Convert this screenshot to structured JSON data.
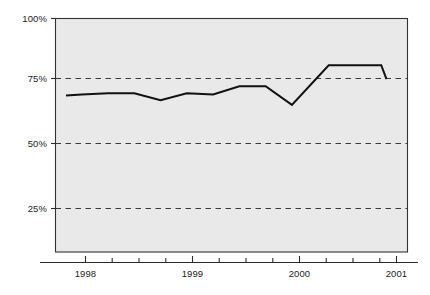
{
  "chart_data": {
    "type": "line",
    "title": "",
    "subtitle": "",
    "xlabel": "",
    "ylabel": "",
    "ylim": [
      0,
      100
    ],
    "xlim": [
      1997.75,
      2001.1
    ],
    "grid": true,
    "grid_style": "dashed-horizontal",
    "legend": "none",
    "y_ticks": [
      25,
      50,
      75,
      100
    ],
    "y_tick_labels": [
      "25%",
      "50%",
      "75%",
      "100%"
    ],
    "x_ticks": [
      1998,
      1999,
      2000,
      2001
    ],
    "x_tick_labels": [
      "1998",
      "1999",
      "2000",
      "2001"
    ],
    "x_minor_ticks": [
      1998.25,
      1998.5,
      1998.75,
      1999.25,
      1999.5,
      1999.75,
      2000.25,
      2000.5,
      2000.75
    ],
    "series": [
      {
        "name": "value",
        "color": "#111111",
        "x": [
          1997.85,
          1998.0,
          1998.25,
          1998.5,
          1998.75,
          1999.0,
          1999.25,
          1999.5,
          1999.75,
          2000.0,
          2000.35,
          2000.6,
          2000.85,
          2000.9
        ],
        "values": [
          67,
          67.5,
          68,
          68,
          65,
          68,
          67.5,
          71,
          71,
          63,
          80,
          80,
          80,
          74
        ]
      }
    ],
    "colors": {
      "plot_background": "#e9e9e9",
      "page_background": "#ffffff",
      "line": "#111111",
      "gridline": "#3a3a3a",
      "axis": "#2b2b2b",
      "tick_text": "#1d1d1d"
    }
  }
}
